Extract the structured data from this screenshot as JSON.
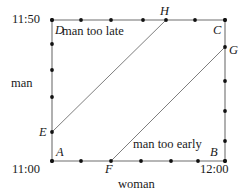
{
  "figure": {
    "type": "diagram",
    "axes": {
      "x": {
        "name": "woman",
        "min_label": "11:00",
        "max_label": "12:00",
        "ticks": 7
      },
      "y": {
        "name": "man",
        "min_label": "11:00",
        "max_label": "11:50",
        "ticks": 6
      }
    },
    "regions": [
      {
        "id": "late",
        "label": "man too late"
      },
      {
        "id": "early",
        "label": "man too early"
      }
    ],
    "points": [
      {
        "id": "A",
        "label": "A",
        "x": 52,
        "y": 161
      },
      {
        "id": "B",
        "label": "B",
        "x": 225,
        "y": 161
      },
      {
        "id": "C",
        "label": "C",
        "x": 225,
        "y": 20
      },
      {
        "id": "D",
        "label": "D",
        "x": 52,
        "y": 20
      },
      {
        "id": "E",
        "label": "E",
        "x": 52,
        "y": 132
      },
      {
        "id": "F",
        "label": "F",
        "x": 111,
        "y": 161
      },
      {
        "id": "G",
        "label": "G",
        "x": 225,
        "y": 47
      },
      {
        "id": "H",
        "label": "H",
        "x": 166,
        "y": 20
      }
    ],
    "style": {
      "line_color": "#6f6f6f",
      "dot_color": "#111111",
      "background": "#ffffff"
    }
  }
}
